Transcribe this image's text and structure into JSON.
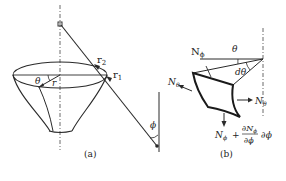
{
  "figure": {
    "panel_a": {
      "caption": "(a)",
      "labels": {
        "r2": "r",
        "r2_sub": "2",
        "r1": "r",
        "r1_sub": "1",
        "theta": "θ",
        "r": "r",
        "phi": "ϕ"
      }
    },
    "panel_b": {
      "caption": "(b)",
      "labels": {
        "N_phi_top": "N",
        "N_phi_top_sub": "ϕ",
        "theta": "θ",
        "d_theta": "dθ",
        "N_theta_left": "N",
        "N_theta_left_sub": "θ",
        "N_theta_right": "N",
        "N_theta_right_sub": "θ",
        "N_phi_bottom": "N",
        "N_phi_bottom_sub": "ϕ",
        "plus": "+",
        "partial_num": "∂N",
        "partial_num_sub": "ϕ",
        "partial_den": "∂ϕ",
        "d_phi": "∂ϕ"
      }
    }
  },
  "colors": {
    "stroke": "#2a2a2a",
    "background": "#ffffff"
  }
}
